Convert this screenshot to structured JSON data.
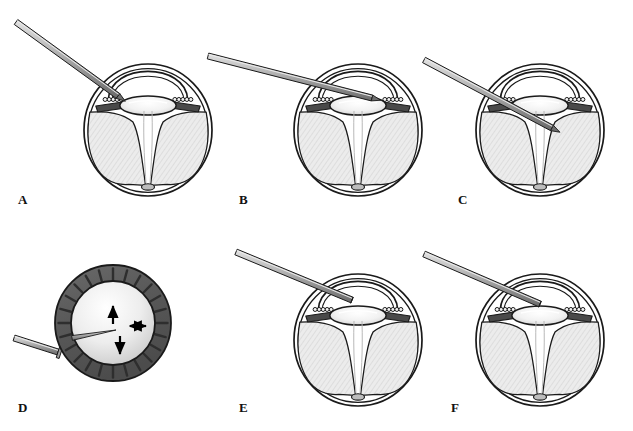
{
  "figure": {
    "background_color": "#ffffff",
    "width": 633,
    "height": 431,
    "panel_count": 6,
    "panel_label_style": "serif-bold-uppercase"
  },
  "palette": {
    "outline": "#1a1a1a",
    "sclera_fill": "#ffffff",
    "retina_fill": "#e8e8e8",
    "retina_hatch": "#cfcfcf",
    "iris_dark": "#4a4a4a",
    "ciliary_ring": "#585858",
    "lens_light": "#fbfbfb",
    "lens_shadow": "#d8d8d8",
    "needle_light": "#d6d6d6",
    "needle_mid": "#9a9a9a",
    "needle_dark": "#6e6e6e",
    "arrow_black": "#000000",
    "disc_fill": "#bdbdbd"
  },
  "panels": [
    {
      "id": "A",
      "label": "A",
      "label_x": 18,
      "label_y": 204,
      "view": "cross-section",
      "caption_semantics": "Needle approaching the limbus from upper left, tip at the iris root; retina detached in two lobes converging at optic disc.",
      "eye": {
        "cx": 148,
        "cy": 130,
        "rx": 64,
        "ry": 66
      },
      "needle": {
        "from_x": 16,
        "from_y": 22,
        "to_x": 118,
        "to_y": 96,
        "tip": "beveled",
        "inserted": false
      },
      "label_position": "bottom-left"
    },
    {
      "id": "B",
      "label": "B",
      "label_x": 239,
      "label_y": 204,
      "view": "cross-section",
      "caption_semantics": "Needle passed through the sclera into the anterior chamber, shaft crossing behind the iris toward the lens equator.",
      "eye": {
        "cx": 358,
        "cy": 130,
        "rx": 64,
        "ry": 66
      },
      "needle": {
        "from_x": 208,
        "from_y": 56,
        "to_x": 372,
        "to_y": 98,
        "tip": "beveled",
        "inserted": true
      },
      "label_position": "bottom-left"
    },
    {
      "id": "C",
      "label": "C",
      "label_x": 458,
      "label_y": 204,
      "view": "cross-section",
      "caption_semantics": "Needle advanced further, tip directed posteriorly past the lens into the retrolental space.",
      "eye": {
        "cx": 540,
        "cy": 130,
        "rx": 64,
        "ry": 66
      },
      "needle": {
        "from_x": 424,
        "from_y": 60,
        "to_x": 552,
        "to_y": 128,
        "tip": "beveled",
        "inserted": true
      },
      "label_position": "bottom-left"
    },
    {
      "id": "D",
      "label": "D",
      "label_x": 18,
      "label_y": 412,
      "view": "en-face",
      "caption_semantics": "En-face view of the ciliary ring and lens; needle tip in the centre with arrows showing superior, inferior and lateral excursion of the tip.",
      "ring": {
        "cx": 113,
        "cy": 323,
        "r_outer": 58,
        "r_inner": 42,
        "spoke_count": 24
      },
      "needle": {
        "from_x": 14,
        "from_y": 338,
        "to_x": 58,
        "to_y": 352,
        "tip": "hub",
        "inserted": false
      },
      "inner_needle": {
        "from_x": 72,
        "from_y": 338,
        "to_x": 116,
        "to_y": 330
      },
      "arrows": [
        {
          "name": "up-arrow",
          "dir": "up",
          "x": 113,
          "y": 312
        },
        {
          "name": "down-arrow",
          "dir": "down",
          "x": 120,
          "y": 340
        },
        {
          "name": "horizontal-double-arrow",
          "dir": "horizontal",
          "x": 138,
          "y": 326
        }
      ],
      "label_position": "bottom-left"
    },
    {
      "id": "E",
      "label": "E",
      "label_x": 239,
      "label_y": 412,
      "view": "cross-section",
      "caption_semantics": "Blunt cannula seated in the posterior chamber behind the iris, port directed toward the vitreous cavity.",
      "eye": {
        "cx": 358,
        "cy": 340,
        "rx": 64,
        "ry": 66
      },
      "needle": {
        "from_x": 236,
        "from_y": 252,
        "to_x": 352,
        "to_y": 300,
        "tip": "blunt-cannula",
        "inserted": true
      },
      "label_position": "bottom-left"
    },
    {
      "id": "F",
      "label": "F",
      "label_x": 451,
      "label_y": 412,
      "view": "cross-section",
      "caption_semantics": "Cannula in final position with the retinal lobes reattaching; subretinal fluid displaced toward the optic disc.",
      "eye": {
        "cx": 540,
        "cy": 340,
        "rx": 64,
        "ry": 66
      },
      "needle": {
        "from_x": 424,
        "from_y": 254,
        "to_x": 540,
        "to_y": 304,
        "tip": "blunt-cannula",
        "inserted": true
      },
      "label_position": "bottom-left"
    }
  ]
}
